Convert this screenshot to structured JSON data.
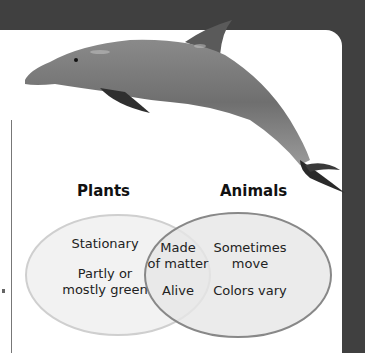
{
  "diagram": {
    "left_set": {
      "title": "Plants",
      "items": [
        "Stationary",
        "Partly or mostly green"
      ],
      "item_lines": [
        [
          "Stationary"
        ],
        [
          "Partly or",
          "mostly green"
        ]
      ]
    },
    "right_set": {
      "title": "Animals",
      "items": [
        "Sometimes move",
        "Colors vary"
      ],
      "item_lines": [
        [
          "Sometimes",
          "move"
        ],
        [
          "Colors vary"
        ]
      ]
    },
    "intersection": {
      "items": [
        "Made of matter",
        "Alive"
      ],
      "item_lines": [
        [
          "Made",
          "of matter"
        ],
        [
          "Alive"
        ]
      ]
    },
    "image": "dolphin-photo",
    "colors": {
      "frame": "#404040",
      "left_fill": "#f2f2f2",
      "right_fill": "#e6e6e6",
      "outline": "#888888"
    }
  }
}
